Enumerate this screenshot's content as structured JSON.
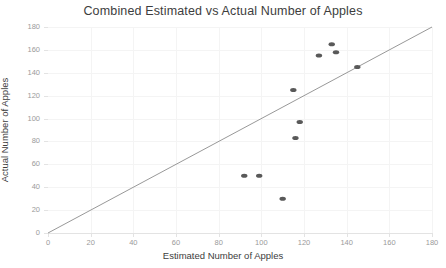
{
  "chart_data": {
    "type": "scatter",
    "title": "Combined Estimated vs Actual Number of Apples",
    "xlabel": "Estimated Number of Apples",
    "ylabel": "Actual Number of Apples",
    "xlim": [
      0,
      180
    ],
    "ylim": [
      0,
      180
    ],
    "xticks": [
      0,
      20,
      40,
      60,
      80,
      100,
      120,
      140,
      160,
      180
    ],
    "yticks": [
      0,
      20,
      40,
      60,
      80,
      100,
      120,
      140,
      160,
      180
    ],
    "grid": true,
    "legend": "none",
    "series": [
      {
        "name": "Apple counts",
        "marker": "ellipse",
        "color": "#595959",
        "points": [
          {
            "x": 92,
            "y": 50
          },
          {
            "x": 99,
            "y": 50
          },
          {
            "x": 110,
            "y": 30
          },
          {
            "x": 115,
            "y": 125
          },
          {
            "x": 116,
            "y": 83
          },
          {
            "x": 118,
            "y": 97
          },
          {
            "x": 127,
            "y": 155
          },
          {
            "x": 133,
            "y": 165
          },
          {
            "x": 135,
            "y": 158
          },
          {
            "x": 145,
            "y": 145
          }
        ]
      }
    ],
    "reference_line": {
      "name": "y = x identity line",
      "from": {
        "x": 0,
        "y": 0
      },
      "to": {
        "x": 180,
        "y": 180
      },
      "color": "#8c8c8c"
    }
  },
  "colors": {
    "marker": "#595959",
    "reference_line": "#8c8c8c",
    "axis": "#e3e3e3",
    "grid": "#f4f4f4",
    "tick_text": "#9a9a9a",
    "label_text": "#3d3d3d",
    "background": "#ffffff"
  }
}
